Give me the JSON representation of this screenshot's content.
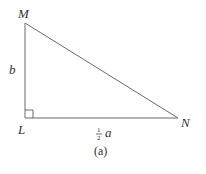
{
  "figure": {
    "caption": "(a)",
    "vertices": {
      "M": {
        "label": "M",
        "x": 25,
        "y": 23
      },
      "L": {
        "label": "L",
        "x": 25,
        "y": 118
      },
      "N": {
        "label": "N",
        "x": 178,
        "y": 118
      }
    },
    "sides": {
      "LM": {
        "label": "b"
      },
      "LN": {
        "label_fraction_num": "1",
        "label_fraction_den": "2",
        "label_var": "a"
      }
    },
    "right_angle_at": "L",
    "line_color": "#6b6b6b"
  }
}
